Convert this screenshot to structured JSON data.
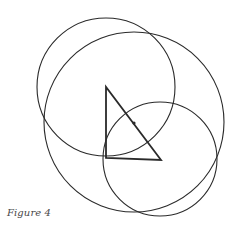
{
  "figure": {
    "caption": "Figure 4",
    "stroke_color": "#2a2a2a",
    "triangle": {
      "vertices": [
        [
          106,
          87
        ],
        [
          106,
          158
        ],
        [
          161,
          160
        ]
      ],
      "label": "right triangle"
    },
    "midpoint_dot": {
      "cx": 134,
      "cy": 123,
      "r": 1.6
    },
    "circles": [
      {
        "name": "circle-centered-top-vertex",
        "cx": 106,
        "cy": 87,
        "r": 69
      },
      {
        "name": "circle-centered-hypotenuse-midpoint",
        "cx": 134,
        "cy": 122,
        "r": 90
      },
      {
        "name": "circle-centered-right-vertex",
        "cx": 160,
        "cy": 159,
        "r": 57
      }
    ]
  }
}
